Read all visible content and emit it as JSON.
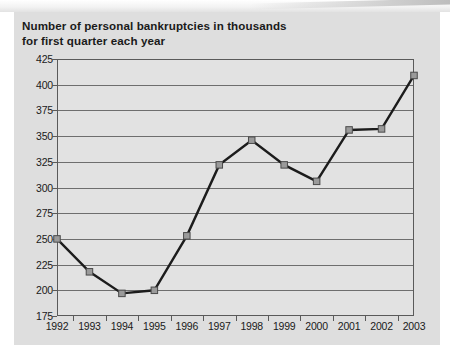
{
  "title": {
    "line1": "Number of personal bankruptcies in thousands",
    "line2": "for first quarter each year"
  },
  "colors": {
    "panel_background": "#dedede",
    "plot_background": "#e2e2e2",
    "gridline": "#6e6e6e",
    "axis": "#5a5a5a",
    "line": "#1c1c1c",
    "marker_fill": "#9a9a9a",
    "marker_stroke": "#4a4a4a",
    "text": "#1a1a1a"
  },
  "chart_data": {
    "type": "line",
    "title": "Number of personal bankruptcies in thousands for first quarter each year",
    "xlabel": "",
    "ylabel": "",
    "categories": [
      "1992",
      "1993",
      "1994",
      "1995",
      "1996",
      "1997",
      "1998",
      "1999",
      "2000",
      "2001",
      "2002",
      "2003"
    ],
    "values": [
      250,
      218,
      197,
      200,
      253,
      322,
      346,
      322,
      306,
      356,
      357,
      409
    ],
    "ylim": [
      175,
      425
    ],
    "ytick_labels": [
      "175",
      "200",
      "225",
      "250",
      "275",
      "300",
      "325",
      "350",
      "375",
      "400",
      "425"
    ],
    "ytick_values": [
      175,
      200,
      225,
      250,
      275,
      300,
      325,
      350,
      375,
      400,
      425
    ],
    "grid": true,
    "legend": false,
    "marker": "square",
    "units": "thousands"
  }
}
